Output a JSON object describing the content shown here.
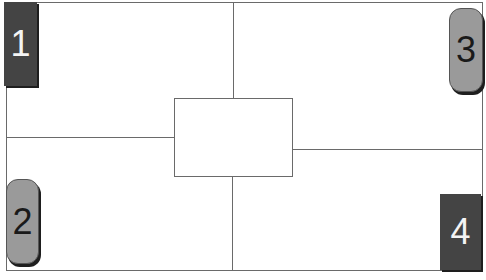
{
  "diagram": {
    "quadrants": [
      {
        "id": 1,
        "label": "1",
        "position": "top-left",
        "style": "dark-square"
      },
      {
        "id": 2,
        "label": "2",
        "position": "bottom-left",
        "style": "gray-rounded"
      },
      {
        "id": 3,
        "label": "3",
        "position": "top-right",
        "style": "gray-rounded"
      },
      {
        "id": 4,
        "label": "4",
        "position": "bottom-right",
        "style": "dark-square"
      }
    ],
    "center_box": {
      "label": ""
    },
    "colors": {
      "dark_tile": "#444444",
      "light_tile": "#9a9a9a",
      "line": "#6a6a6a"
    }
  }
}
